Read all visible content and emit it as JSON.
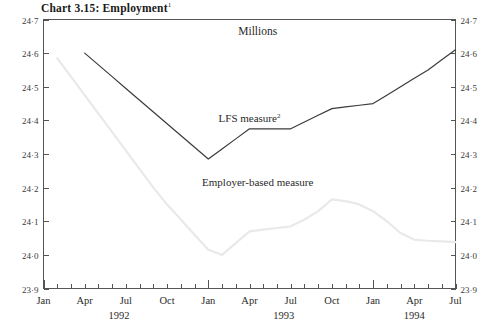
{
  "chart_data": {
    "type": "line",
    "title": "Chart 3.15: Employment",
    "title_superscript": "1",
    "ylabel": "Millions",
    "xlabel": "",
    "ylim": [
      23.9,
      24.7
    ],
    "ytick_labels": [
      "24·7",
      "24·6",
      "24·5",
      "24·4",
      "24·3",
      "24·2",
      "24·1",
      "24·0",
      "23·9"
    ],
    "ytick_values": [
      24.7,
      24.6,
      24.5,
      24.4,
      24.3,
      24.2,
      24.1,
      24.0,
      23.9
    ],
    "right_axis": true,
    "grid": false,
    "legend_position": "inline-annotations",
    "x_month_labels": [
      "Jan",
      "Apr",
      "Jul",
      "Oct",
      "Jan",
      "Apr",
      "Jul",
      "Oct",
      "Jan",
      "Apr",
      "Jul"
    ],
    "x_year_labels": [
      "1992",
      "1993",
      "1994"
    ],
    "x_start": "1992-01",
    "x_end": "1994-07",
    "x_tick_interval": "monthly",
    "x_major_ticks": [
      "Jan 1992",
      "Jan 1993",
      "Jan 1994"
    ],
    "x": [
      "1992-01",
      "1992-02",
      "1992-03",
      "1992-04",
      "1992-05",
      "1992-06",
      "1992-07",
      "1992-08",
      "1992-09",
      "1992-10",
      "1992-11",
      "1992-12",
      "1993-01",
      "1993-02",
      "1993-03",
      "1993-04",
      "1993-05",
      "1993-06",
      "1993-07",
      "1993-08",
      "1993-09",
      "1993-10",
      "1993-11",
      "1993-12",
      "1994-01",
      "1994-02",
      "1994-03",
      "1994-04",
      "1994-05",
      "1994-06",
      "1994-07"
    ],
    "series": [
      {
        "name": "LFS measure",
        "superscript": "2",
        "color": "#3b3b3b",
        "start_index": 3,
        "label_x": "1993-01",
        "values": [
          null,
          null,
          null,
          24.6,
          24.565,
          24.53,
          24.495,
          24.46,
          24.425,
          24.39,
          24.355,
          24.32,
          24.285,
          24.315,
          24.345,
          24.375,
          24.375,
          24.375,
          24.375,
          24.395,
          24.415,
          24.435,
          24.44,
          24.445,
          24.45,
          24.475,
          24.5,
          24.525,
          24.55,
          24.58,
          24.61
        ]
      },
      {
        "name": "Employer-based measure",
        "superscript": "",
        "color": "#e9e9e9",
        "start_index": 1,
        "label_x": "1993-02",
        "values": [
          null,
          24.585,
          24.53,
          24.475,
          24.42,
          24.365,
          24.31,
          24.255,
          24.2,
          24.15,
          24.105,
          24.06,
          24.015,
          24.0,
          24.035,
          24.07,
          24.075,
          24.08,
          24.085,
          24.105,
          24.13,
          24.165,
          24.16,
          24.15,
          24.13,
          24.1,
          24.065,
          24.045,
          24.042,
          24.04,
          24.038
        ]
      }
    ],
    "annotations": [
      {
        "text": "Millions",
        "x_frac": 0.52,
        "y_value": 24.655
      },
      {
        "text": "LFS measure",
        "superscript": "2",
        "x_frac": 0.5,
        "y_value": 24.395
      },
      {
        "text": "Employer-based measure",
        "superscript": "",
        "x_frac": 0.52,
        "y_value": 24.205
      }
    ]
  }
}
